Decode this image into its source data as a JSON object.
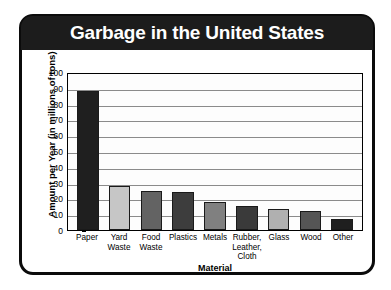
{
  "card": {
    "title": "Garbage in the United States"
  },
  "chart_data": {
    "type": "bar",
    "title": "Garbage in the United States",
    "xlabel": "Material",
    "ylabel": "Amount per Year (in millions of tons)",
    "ylim": [
      0,
      100
    ],
    "ytick_labels": [
      "100",
      "90",
      "80",
      "70",
      "60",
      "50",
      "40",
      "30",
      "20",
      "10",
      "0"
    ],
    "ytick_values": [
      100,
      90,
      80,
      70,
      60,
      50,
      40,
      30,
      20,
      10,
      0
    ],
    "grid": true,
    "legend": false,
    "categories": [
      "Paper",
      "Yard Waste",
      "Food Waste",
      "Plastics",
      "Metals",
      "Rubber, Leather, Cloth",
      "Glass",
      "Wood",
      "Other"
    ],
    "category_lines": [
      [
        "Paper"
      ],
      [
        "Yard",
        "Waste"
      ],
      [
        "Food",
        "Waste"
      ],
      [
        "Plastics"
      ],
      [
        "Metals"
      ],
      [
        "Rubber,",
        "Leather,",
        "Cloth"
      ],
      [
        "Glass"
      ],
      [
        "Wood"
      ],
      [
        "Other"
      ]
    ],
    "values": [
      88,
      28,
      25,
      24,
      18,
      15,
      13,
      12,
      7
    ],
    "bar_colors": [
      "#1f1f1f",
      "#c6c6c6",
      "#636363",
      "#3d3d3d",
      "#808080",
      "#3a3a3a",
      "#b0b0b0",
      "#555555",
      "#1f1f1f"
    ]
  },
  "colors": {
    "header_background": "#1c1c1c",
    "header_text": "#ffffff",
    "card_border": "#0b0b0b",
    "gridline": "#8b8b8b",
    "axis": "#000000",
    "plot_background": "#fdfdfd"
  }
}
